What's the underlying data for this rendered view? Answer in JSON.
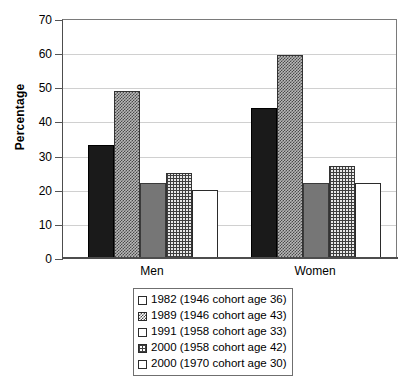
{
  "chart_data": {
    "type": "bar",
    "title": "",
    "xlabel": "",
    "ylabel": "Percentage",
    "ylim": [
      0,
      70
    ],
    "ytick_step": 10,
    "yticks": [
      70,
      60,
      50,
      40,
      30,
      20,
      10,
      0
    ],
    "grid": true,
    "legend_position": "bottom",
    "categories": [
      "Men",
      "Women"
    ],
    "series": [
      {
        "name": "1982 (1946 cohort age 36)",
        "values": [
          33,
          44
        ],
        "pattern": "solid-black",
        "swatch_color": "#1a1a1a"
      },
      {
        "name": "1989 (1946 cohort age 43)",
        "values": [
          49,
          59.5
        ],
        "pattern": "checker",
        "swatch_color": "#8f8f8f"
      },
      {
        "name": "1991 (1958 cohort age 33)",
        "values": [
          22,
          22
        ],
        "pattern": "solid-grey",
        "swatch_color": "#767676"
      },
      {
        "name": "2000 (1958 cohort age 42)",
        "values": [
          25,
          27
        ],
        "pattern": "grid",
        "swatch_color": "#c8c8c8"
      },
      {
        "name": "2000 (1970 cohort age 30)",
        "values": [
          20,
          22
        ],
        "pattern": "white",
        "swatch_color": "#ffffff"
      }
    ]
  },
  "axis": {
    "y_title": "Percentage",
    "y_tick_labels": [
      "70",
      "60",
      "50",
      "40",
      "30",
      "20",
      "10",
      "0"
    ],
    "x_group_labels": [
      "Men",
      "Women"
    ]
  },
  "legend": {
    "items": [
      {
        "label": "1982 (1946 cohort age 36)"
      },
      {
        "label": "1989 (1946 cohort age 43)"
      },
      {
        "label": "1991 (1958 cohort age 33)"
      },
      {
        "label": "2000 (1958 cohort age 42)"
      },
      {
        "label": "2000 (1970 cohort age 30)"
      }
    ]
  }
}
